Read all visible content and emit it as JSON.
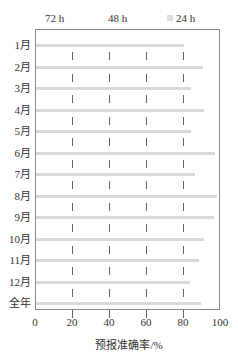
{
  "chart_data": {
    "type": "bar",
    "orientation": "horizontal",
    "categories": [
      "1月",
      "2月",
      "3月",
      "4月",
      "5月",
      "6月",
      "7月",
      "8月",
      "9月",
      "10月",
      "11月",
      "12月",
      "全年"
    ],
    "series": [
      {
        "name": "24 h",
        "values": [
          80,
          90,
          84,
          91,
          84,
          97,
          86,
          98,
          96,
          91,
          88,
          83,
          89
        ]
      }
    ],
    "legend": [
      "72 h",
      "48 h",
      "24 h"
    ],
    "xlabel": "预报准确率/%",
    "ylabel": "",
    "xlim": [
      0,
      100
    ],
    "xticks": [
      0,
      20,
      40,
      60,
      80,
      100
    ],
    "legend_position": "top"
  },
  "legend": {
    "l72": "72 h",
    "l48": "48 h",
    "l24": "24 h"
  },
  "xticks": [
    "0",
    "20",
    "40",
    "60",
    "80",
    "100"
  ],
  "xtitle": "预报准确率/%",
  "months": [
    "1月",
    "2月",
    "3月",
    "4月",
    "5月",
    "6月",
    "7月",
    "8月",
    "9月",
    "10月",
    "11月",
    "12月",
    "全年"
  ]
}
